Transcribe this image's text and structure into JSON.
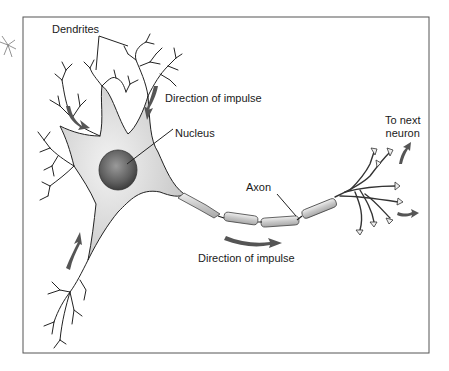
{
  "diagram": {
    "labels": {
      "dendrites": "Dendrites",
      "direction_top": "Direction of impulse",
      "nucleus": "Nucleus",
      "axon": "Axon",
      "direction_bottom": "Direction of impulse",
      "to_next_line1": "To next",
      "to_next_line2": "neuron"
    },
    "colors": {
      "frame": "#555555",
      "cell_fill": "#dcdcdc",
      "nucleus_fill": "#6e6e6e",
      "arrow": "#505050",
      "line": "#1a1a1a"
    }
  }
}
